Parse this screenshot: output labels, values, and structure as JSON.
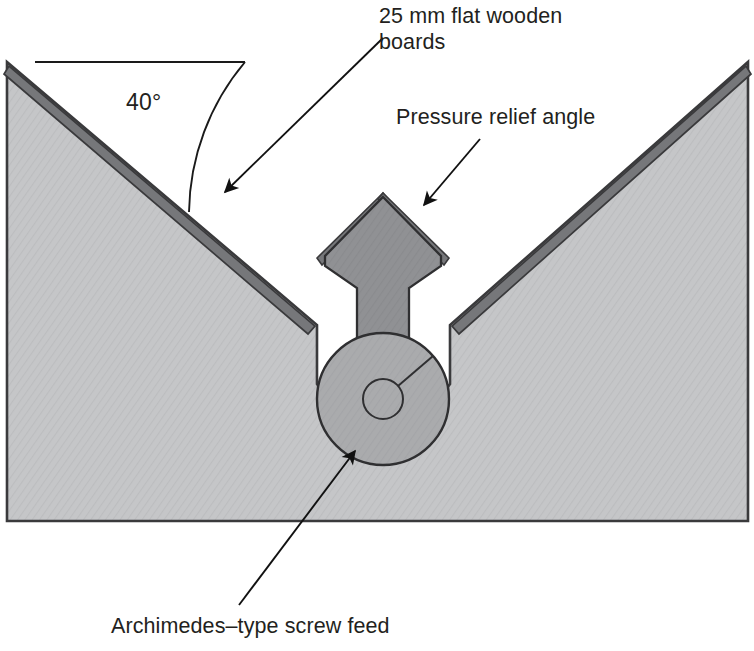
{
  "figure": {
    "type": "engineering-cross-section",
    "width": 754,
    "height": 651,
    "background_color": "#ffffff"
  },
  "colors": {
    "hopper_fill": "#c3c4c6",
    "hopper_outline": "#3a3a3c",
    "board_dark": "#76777a",
    "cone_fill": "#8e8f92",
    "screw_fill": "#a8a9ac",
    "trough_void": "#ffffff",
    "leader_line": "#1a1a1a",
    "text": "#231f20"
  },
  "labels": {
    "angle": {
      "text": "40°",
      "value": 40,
      "unit": "degrees",
      "measured_from": "horizontal reference line",
      "x": 126,
      "y": 88
    },
    "boards": {
      "text": "25 mm flat wooden\nboards",
      "line1": "25 mm flat wooden",
      "line2": "boards",
      "thickness_value": 25,
      "thickness_unit": "mm",
      "x": 379,
      "y": 3
    },
    "relief": {
      "text": "Pressure relief angle",
      "x": 396,
      "y": 104
    },
    "screw": {
      "text": "Archimedes–type screw feed",
      "x": 111,
      "y": 613
    }
  },
  "leaders": [
    {
      "name": "boards-leader",
      "from_x": 383,
      "from_y": 38,
      "to_x": 222,
      "to_y": 195,
      "arrowhead": true
    },
    {
      "name": "relief-leader",
      "from_x": 480,
      "from_y": 139,
      "to_x": 421,
      "to_y": 208,
      "arrowhead": true
    },
    {
      "name": "screw-leader",
      "from_x": 239,
      "from_y": 605,
      "to_x": 358,
      "to_y": 448,
      "arrowhead": true
    }
  ],
  "geometry": {
    "hopper": {
      "left_peak": {
        "x": 7,
        "y": 62
      },
      "right_peak": {
        "x": 748,
        "y": 62
      },
      "bottom_y": 521,
      "left_notch_x": 317,
      "right_notch_x": 450,
      "notch_top_y": 325
    },
    "reference_line": {
      "x1": 35,
      "x2": 245,
      "y": 62
    },
    "angle_arc": {
      "center_x": 7,
      "center_y": 62,
      "radius": 238,
      "start_deg": 0,
      "end_deg": 40
    },
    "screw": {
      "center_x": 383,
      "center_y": 399,
      "outer_radius": 66,
      "hub_radius": 20,
      "trough_radius": 80,
      "radius_line_angle_deg": 40
    },
    "cone": {
      "apex_x": 383,
      "apex_y": 193,
      "half_width": 58,
      "shoulder_y": 268,
      "shaft_half_width": 26,
      "shaft_bottom_y": 337,
      "board_overhang": 34
    }
  }
}
